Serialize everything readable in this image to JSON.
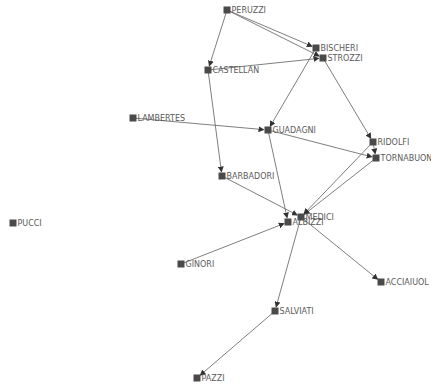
{
  "graph": {
    "title": "",
    "colors": {
      "node": "#4a4a4a",
      "edge": "#6f6f6f",
      "label": "#5a5a5a"
    },
    "nodes": [
      {
        "id": "PERUZZI",
        "label": "PERUZZI"
      },
      {
        "id": "BISCHERI",
        "label": "BISCHERI"
      },
      {
        "id": "STROZZI",
        "label": "STROZZI"
      },
      {
        "id": "CASTELLAN",
        "label": "CASTELLAN"
      },
      {
        "id": "LAMBERTES",
        "label": "LAMBERTES"
      },
      {
        "id": "GUADAGNI",
        "label": "GUADAGNI"
      },
      {
        "id": "RIDOLFI",
        "label": "RIDOLFI"
      },
      {
        "id": "TORNABUON",
        "label": "TORNABUON"
      },
      {
        "id": "BARBADORI",
        "label": "BARBADORI"
      },
      {
        "id": "MEDICI",
        "label": "MEDICI"
      },
      {
        "id": "ALBIZZI",
        "label": "ALBIZZI"
      },
      {
        "id": "PUCCI",
        "label": "PUCCI"
      },
      {
        "id": "GINORI",
        "label": "GINORI"
      },
      {
        "id": "ACCIAIUOL",
        "label": "ACCIAIUOL"
      },
      {
        "id": "SALVIATI",
        "label": "SALVIATI"
      },
      {
        "id": "PAZZI",
        "label": "PAZZI"
      }
    ],
    "edges": [
      [
        "PERUZZI",
        "CASTELLAN"
      ],
      [
        "PERUZZI",
        "BISCHERI"
      ],
      [
        "PERUZZI",
        "STROZZI"
      ],
      [
        "CASTELLAN",
        "STROZZI"
      ],
      [
        "CASTELLAN",
        "BARBADORI"
      ],
      [
        "BISCHERI",
        "GUADAGNI"
      ],
      [
        "STROZZI",
        "RIDOLFI"
      ],
      [
        "LAMBERTES",
        "GUADAGNI"
      ],
      [
        "GUADAGNI",
        "TORNABUON"
      ],
      [
        "GUADAGNI",
        "ALBIZZI"
      ],
      [
        "RIDOLFI",
        "TORNABUON"
      ],
      [
        "RIDOLFI",
        "MEDICI"
      ],
      [
        "TORNABUON",
        "MEDICI"
      ],
      [
        "BARBADORI",
        "MEDICI"
      ],
      [
        "MEDICI",
        "ACCIAIUOL"
      ],
      [
        "MEDICI",
        "SALVIATI"
      ],
      [
        "GINORI",
        "ALBIZZI"
      ],
      [
        "SALVIATI",
        "PAZZI"
      ]
    ]
  }
}
